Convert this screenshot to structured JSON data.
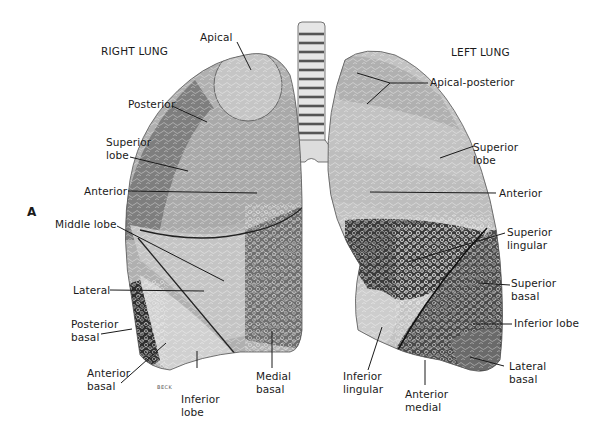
{
  "figure": {
    "panel_letter": "A",
    "signature": "BECK"
  },
  "right_lung": {
    "title": "RIGHT LUNG",
    "labels": {
      "apical": "Apical",
      "posterior": "Posterior",
      "superior_lobe": "Superior\nlobe",
      "anterior": "Anterior",
      "middle_lobe": "Middle lobe",
      "lateral": "Lateral",
      "posterior_basal": "Posterior\nbasal",
      "anterior_basal": "Anterior\nbasal",
      "inferior_lobe": "Inferior\nlobe",
      "medial_basal": "Medial\nbasal"
    }
  },
  "left_lung": {
    "title": "LEFT LUNG",
    "labels": {
      "apical_posterior": "Apical-posterior",
      "superior_lobe": "Superior\nlobe",
      "anterior": "Anterior",
      "superior_lingular": "Superior\nlingular",
      "superior_basal": "Superior\nbasal",
      "inferior_lobe": "Inferior lobe",
      "lateral_basal": "Lateral\nbasal",
      "inferior_lingular": "Inferior\nlingular",
      "anterior_medial": "Anterior\nmedial"
    }
  },
  "colors": {
    "light_segment": "#c9c9c9",
    "mid_segment": "#a8a8a8",
    "dark_segment": "#7a7a7a",
    "darkest_segment": "#3c3c3c",
    "outline": "#3a3a3a",
    "leader_line": "#1a1a1a"
  }
}
